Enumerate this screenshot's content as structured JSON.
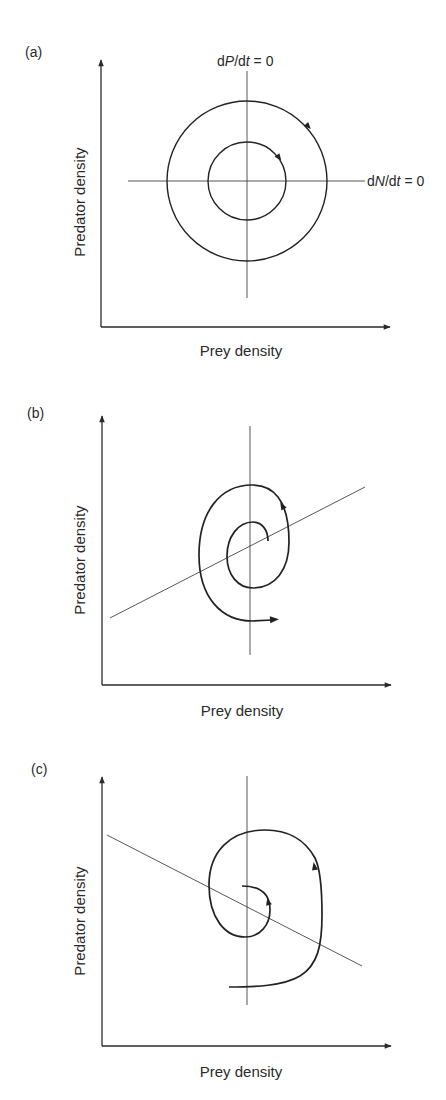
{
  "figure": {
    "panels": [
      {
        "id": "a",
        "label": "(a)",
        "xlabel": "Prey density",
        "ylabel": "Predator density",
        "nullcline_prey_label": "dN/dt = 0",
        "nullcline_predator_label": "dP/dt = 0",
        "dynamics": "neutral cycles (closed orbits)",
        "direction": "clockwise"
      },
      {
        "id": "b",
        "label": "(b)",
        "xlabel": "Prey density",
        "ylabel": "Predator density",
        "prey_nullcline_slope": "positive",
        "dynamics": "diverging spiral (unstable)",
        "direction": "counterclockwise"
      },
      {
        "id": "c",
        "label": "(c)",
        "xlabel": "Prey density",
        "ylabel": "Predator density",
        "prey_nullcline_slope": "negative",
        "dynamics": "converging spiral (stable)",
        "direction": "counterclockwise"
      }
    ],
    "colors": {
      "ink": "#222222",
      "background": "#ffffff"
    }
  },
  "labels": {
    "a": {
      "panel": "(a)",
      "x": "Prey density",
      "y": "Predator density",
      "dP": "dP/dt = 0",
      "dN": "dN/dt = 0"
    },
    "b": {
      "panel": "(b)",
      "x": "Prey density",
      "y": "Predator density"
    },
    "c": {
      "panel": "(c)",
      "x": "Prey density",
      "y": "Predator density"
    }
  }
}
